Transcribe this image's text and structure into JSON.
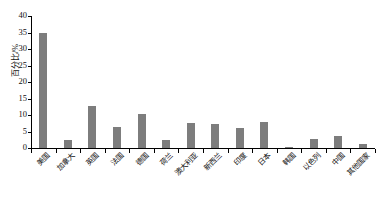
{
  "chart_data": {
    "type": "bar",
    "title": "",
    "xlabel": "",
    "ylabel": "百分比/%",
    "ylim": [
      0,
      40
    ],
    "yticks": [
      0,
      5,
      10,
      15,
      20,
      25,
      30,
      35,
      40
    ],
    "grid": false,
    "legend": null,
    "bar_color": "#7d7d7d",
    "categories": [
      "美国",
      "加拿大",
      "英国",
      "法国",
      "德国",
      "荷兰",
      "澳大利亚",
      "新西兰",
      "印度",
      "日本",
      "韩国",
      "以色列",
      "中国",
      "其他国家"
    ],
    "values": [
      35.0,
      2.5,
      12.8,
      6.3,
      10.3,
      2.4,
      7.6,
      7.3,
      6.2,
      8.0,
      0.2,
      2.6,
      3.5,
      1.3
    ]
  }
}
